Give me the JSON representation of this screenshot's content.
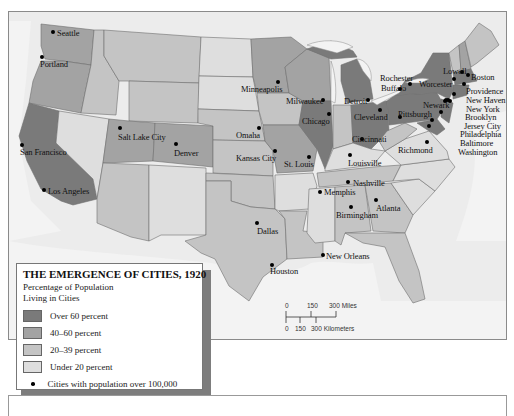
{
  "map": {
    "title": "THE EMERGENCE OF CITIES, 1920",
    "colors": {
      "over60": "#7a7a7a",
      "p40_60": "#a3a3a3",
      "p20_39": "#c4c4c4",
      "under20": "#dedede",
      "water": "#efefef",
      "foreign": "#ebebeb",
      "border": "#6e6e6e"
    }
  },
  "legend": {
    "title": "THE EMERGENCE OF CITIES, 1920",
    "subtitle_line1": "Percentage of Population",
    "subtitle_line2": "Living in Cities",
    "items": [
      {
        "label": "Over 60 percent",
        "color": "#7a7a7a"
      },
      {
        "label": "40–60 percent",
        "color": "#a3a3a3"
      },
      {
        "label": "20–39 percent",
        "color": "#c4c4c4"
      },
      {
        "label": "Under 20 percent",
        "color": "#dedede"
      }
    ],
    "city_marker_label": "Cities with population over 100,000"
  },
  "scale": {
    "miles_ticks": [
      "0",
      "150",
      "300 Miles"
    ],
    "km_ticks": [
      "0",
      "150",
      "300 Kilometers"
    ]
  },
  "cities": [
    {
      "name": "Seattle",
      "dot": [
        53,
        32
      ],
      "label": [
        57,
        29
      ]
    },
    {
      "name": "Portland",
      "dot": [
        42,
        57
      ],
      "label": [
        40,
        60
      ]
    },
    {
      "name": "San Francisco",
      "dot": [
        22,
        145
      ],
      "label": [
        20,
        148
      ]
    },
    {
      "name": "Los Angeles",
      "dot": [
        44,
        190
      ],
      "label": [
        48,
        187
      ]
    },
    {
      "name": "Salt Lake City",
      "dot": [
        120,
        128
      ],
      "label": [
        118,
        133
      ]
    },
    {
      "name": "Denver",
      "dot": [
        176,
        144
      ],
      "label": [
        174,
        149
      ]
    },
    {
      "name": "Minneapolis",
      "dot": [
        278,
        82
      ],
      "label": [
        241,
        85
      ]
    },
    {
      "name": "Omaha",
      "dot": [
        259,
        128
      ],
      "label": [
        236,
        131
      ]
    },
    {
      "name": "Kansas City",
      "dot": [
        275,
        151
      ],
      "label": [
        236,
        154
      ]
    },
    {
      "name": "Milwaukee",
      "dot": [
        323,
        100
      ],
      "label": [
        286,
        97
      ]
    },
    {
      "name": "Chicago",
      "dot": [
        329,
        114
      ],
      "label": [
        302,
        117
      ]
    },
    {
      "name": "St. Louis",
      "dot": [
        309,
        157
      ],
      "label": [
        284,
        160
      ]
    },
    {
      "name": "Detroit",
      "dot": [
        368,
        100
      ],
      "label": [
        344,
        97
      ]
    },
    {
      "name": "Cleveland",
      "dot": [
        380,
        110
      ],
      "label": [
        354,
        113
      ]
    },
    {
      "name": "Cincinnati",
      "dot": [
        362,
        139
      ],
      "label": [
        352,
        135
      ]
    },
    {
      "name": "Louisville",
      "dot": [
        350,
        155
      ],
      "label": [
        348,
        159
      ]
    },
    {
      "name": "Nashville",
      "dot": [
        348,
        182
      ],
      "label": [
        353,
        179
      ]
    },
    {
      "name": "Memphis",
      "dot": [
        320,
        192
      ],
      "label": [
        324,
        188
      ]
    },
    {
      "name": "Birmingham",
      "dot": [
        351,
        207
      ],
      "label": [
        336,
        211
      ]
    },
    {
      "name": "Atlanta",
      "dot": [
        376,
        200
      ],
      "label": [
        376,
        204
      ]
    },
    {
      "name": "Dallas",
      "dot": [
        257,
        223
      ],
      "label": [
        257,
        227
      ]
    },
    {
      "name": "Houston",
      "dot": [
        272,
        265
      ],
      "label": [
        270,
        267
      ]
    },
    {
      "name": "New Orleans",
      "dot": [
        323,
        255
      ],
      "label": [
        326,
        252
      ]
    },
    {
      "name": "Rochester",
      "dot": [
        410,
        84
      ],
      "label": [
        380,
        74
      ]
    },
    {
      "name": "Buffalo",
      "dot": [
        400,
        89
      ],
      "label": [
        381,
        84
      ]
    },
    {
      "name": "Worcester",
      "dot": [
        454,
        79
      ],
      "label": [
        419,
        80
      ]
    },
    {
      "name": "Lowell",
      "dot": [
        462,
        72
      ],
      "label": [
        443,
        67
      ]
    },
    {
      "name": "Boston",
      "dot": [
        468,
        75
      ],
      "label": [
        471,
        73
      ]
    },
    {
      "name": "Providence",
      "dot": [
        464,
        84
      ],
      "label": [
        466,
        87
      ]
    },
    {
      "name": "New Haven",
      "dot": [
        454,
        94
      ],
      "label": [
        466,
        96
      ]
    },
    {
      "name": "Newark",
      "dot": [
        445,
        101
      ],
      "label": [
        423,
        101
      ]
    },
    {
      "name": "New York",
      "dot": [
        448,
        100
      ],
      "label": [
        466,
        105
      ]
    },
    {
      "name": "Brooklyn",
      "dot": [
        450,
        101
      ],
      "label": [
        465,
        113
      ]
    },
    {
      "name": "Jersey City",
      "dot": [
        446,
        100
      ],
      "label": [
        464,
        122
      ]
    },
    {
      "name": "Philadelphia",
      "dot": [
        441,
        112
      ],
      "label": [
        460,
        130
      ]
    },
    {
      "name": "Baltimore",
      "dot": [
        432,
        120
      ],
      "label": [
        460,
        139
      ]
    },
    {
      "name": "Washington",
      "dot": [
        429,
        126
      ],
      "label": [
        458,
        148
      ]
    },
    {
      "name": "Pittsburgh",
      "dot": [
        400,
        117
      ],
      "label": [
        398,
        110
      ]
    },
    {
      "name": "Richmond",
      "dot": [
        427,
        142
      ],
      "label": [
        398,
        146
      ]
    }
  ]
}
